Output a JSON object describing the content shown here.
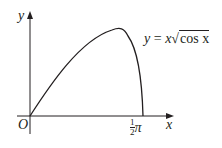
{
  "figure": {
    "equation_lhs": "y",
    "equation_eq": " = ",
    "equation_x": "x",
    "equation_sqrt_sym": "√",
    "equation_radicand": "cos x",
    "origin_label": "O",
    "x_axis_label": "x",
    "y_axis_label": "y",
    "x_intercept_num": "1",
    "x_intercept_den": "2",
    "x_intercept_pi": "π"
  },
  "colors": {
    "ink": "#231f20",
    "background": "#ffffff"
  }
}
